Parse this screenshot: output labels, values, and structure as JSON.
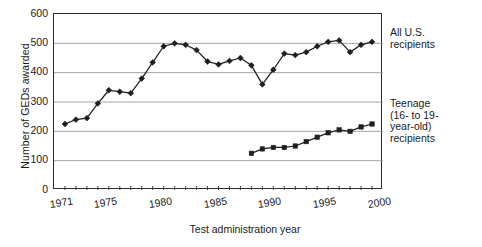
{
  "chart_data": {
    "type": "line",
    "title": "",
    "xlabel": "Test administration year",
    "ylabel": "Number of GEDs awarded",
    "ylim": [
      0,
      600
    ],
    "xlim": [
      1970,
      2000
    ],
    "yticks": [
      600,
      500,
      400,
      300,
      200,
      100,
      0
    ],
    "xticks": [
      1971,
      1975,
      1980,
      1985,
      1990,
      1995,
      2000
    ],
    "grid": "horizontal",
    "legend_position": "right-inline-annotations",
    "units": "thousands",
    "series": [
      {
        "name": "All U.S. recipients",
        "marker": "diamond",
        "x": [
          1971,
          1972,
          1973,
          1974,
          1975,
          1976,
          1977,
          1978,
          1979,
          1980,
          1981,
          1982,
          1983,
          1984,
          1985,
          1986,
          1987,
          1988,
          1989,
          1990,
          1991,
          1992,
          1993,
          1994,
          1995,
          1996,
          1997,
          1998,
          1999
        ],
        "values": [
          225,
          240,
          245,
          295,
          340,
          335,
          330,
          380,
          435,
          490,
          500,
          495,
          477,
          438,
          428,
          440,
          450,
          425,
          360,
          410,
          465,
          460,
          470,
          490,
          505,
          510,
          470,
          495,
          505
        ]
      },
      {
        "name": "Teenage (16- to 19-year-old) recipients",
        "marker": "square",
        "x": [
          1988,
          1989,
          1990,
          1991,
          1992,
          1993,
          1994,
          1995,
          1996,
          1997,
          1998,
          1999
        ],
        "values": [
          125,
          140,
          145,
          145,
          150,
          165,
          180,
          195,
          205,
          200,
          215,
          225
        ]
      }
    ],
    "annotations": [
      {
        "name": "all-us-recipients",
        "lines": [
          "All U.S.",
          "recipients"
        ]
      },
      {
        "name": "teenage-recipients",
        "lines": [
          "Teenage",
          "(16- to 19-",
          "year-old)",
          "recipients"
        ]
      }
    ]
  },
  "axis": {
    "ytitle": "Number of GEDs awarded",
    "xtitle": "Test administration year",
    "ylabels": [
      "600",
      "500",
      "400",
      "300",
      "200",
      "100",
      "0"
    ],
    "xlabels": [
      "1971",
      "1975",
      "1980",
      "1985",
      "1990",
      "1995",
      "2000"
    ]
  },
  "notes": {
    "all": {
      "l1": "All U.S.",
      "l2": "recipients"
    },
    "teen": {
      "l1": "Teenage",
      "l2": "(16- to 19-",
      "l3": "year-old)",
      "l4": "recipients"
    }
  },
  "colors": {
    "line": "#1f1f1f",
    "grid": "#8c8c8c",
    "axis": "#2b2b2b",
    "text": "#1a1a1a",
    "background": "#ffffff"
  }
}
